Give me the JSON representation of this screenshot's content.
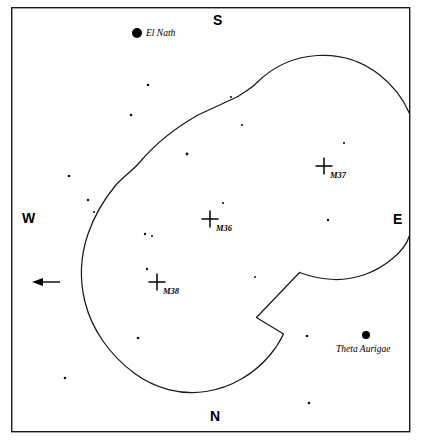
{
  "figure": {
    "type": "star-chart",
    "background_color": "#ffffff",
    "ink_color": "#000000",
    "frame": {
      "x": 11,
      "y": 7,
      "width": 399,
      "height": 425
    }
  },
  "cardinals": [
    {
      "name": "south",
      "label": "S",
      "x": 213,
      "y": 13
    },
    {
      "name": "north",
      "label": "N",
      "x": 210,
      "y": 409
    },
    {
      "name": "west",
      "label": "W",
      "x": 22,
      "y": 211
    },
    {
      "name": "east",
      "label": "E",
      "x": 393,
      "y": 212
    }
  ],
  "bright_stars": [
    {
      "name": "el-nath",
      "label": "El Nath",
      "x": 137,
      "y": 33,
      "radius": 5.0,
      "label_x": 146,
      "label_y": 29
    },
    {
      "name": "theta-aurigae",
      "label": "Theta Aurigae",
      "x": 366,
      "y": 335,
      "radius": 4.0,
      "label_x": 336,
      "label_y": 345
    }
  ],
  "deep_sky_objects": [
    {
      "name": "m37",
      "label": "M37",
      "x": 324,
      "y": 166,
      "label_x": 330,
      "label_y": 171
    },
    {
      "name": "m36",
      "label": "M36",
      "x": 210,
      "y": 219,
      "label_x": 216,
      "label_y": 224
    },
    {
      "name": "m38",
      "label": "M38",
      "x": 157,
      "y": 282,
      "label_x": 163,
      "label_y": 287
    }
  ],
  "field_stars": [
    {
      "x": 148,
      "y": 85,
      "r": 1.3
    },
    {
      "x": 131,
      "y": 115,
      "r": 1.3
    },
    {
      "x": 231,
      "y": 97,
      "r": 1.1
    },
    {
      "x": 242,
      "y": 125,
      "r": 1.1
    },
    {
      "x": 187,
      "y": 154,
      "r": 1.4
    },
    {
      "x": 69,
      "y": 176,
      "r": 1.3
    },
    {
      "x": 88,
      "y": 200,
      "r": 1.3
    },
    {
      "x": 94,
      "y": 212,
      "r": 1.1
    },
    {
      "x": 223,
      "y": 203,
      "r": 1.1
    },
    {
      "x": 145,
      "y": 234,
      "r": 1.2
    },
    {
      "x": 152,
      "y": 236,
      "r": 1.0
    },
    {
      "x": 147,
      "y": 269,
      "r": 1.2
    },
    {
      "x": 344,
      "y": 143,
      "r": 1.1
    },
    {
      "x": 328,
      "y": 220,
      "r": 1.2
    },
    {
      "x": 255,
      "y": 277,
      "r": 1.0
    },
    {
      "x": 138,
      "y": 338,
      "r": 1.3
    },
    {
      "x": 307,
      "y": 336,
      "r": 1.3
    },
    {
      "x": 65,
      "y": 378,
      "r": 1.3
    },
    {
      "x": 309,
      "y": 403,
      "r": 1.3
    }
  ],
  "field_of_view": {
    "description": "two overlapping circular telescope fields with notched intersections",
    "left_circle": {
      "cx": 156,
      "cy": 266,
      "r": 125
    },
    "right_circle": {
      "cx": 322,
      "cy": 188,
      "r": 125
    },
    "notches": [
      {
        "name": "upper-left-notch",
        "x": 115,
        "y": 185
      },
      {
        "name": "upper-right-notch",
        "x": 238,
        "y": 96
      },
      {
        "name": "lower-right-notch",
        "x": 300,
        "y": 272
      },
      {
        "name": "lower-left-notch",
        "x": 256,
        "y": 317
      }
    ]
  },
  "direction_arrow": {
    "name": "motion-arrow",
    "points_to": "west",
    "tail_x": 60,
    "tip_x": 32,
    "y": 282
  }
}
